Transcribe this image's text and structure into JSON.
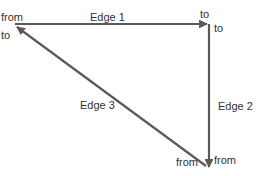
{
  "diagram": {
    "edges": [
      {
        "label": "Edge 1",
        "from_label": "from",
        "to_label": "to"
      },
      {
        "label": "Edge 2",
        "from_label": "to",
        "to_label": "from"
      },
      {
        "label": "Edge 3",
        "from_label": "from",
        "to_label": "to"
      }
    ],
    "colors": {
      "edge": "#5a5a5a",
      "text": "#333333",
      "background": "#ffffff"
    }
  },
  "labels": {
    "edge1": "Edge 1",
    "edge2": "Edge 2",
    "edge3": "Edge 3",
    "top_left_from": "from",
    "top_left_to": "to",
    "top_right_to_1": "to",
    "top_right_to_2": "to",
    "bottom_from_1": "from",
    "bottom_from_2": "from"
  }
}
